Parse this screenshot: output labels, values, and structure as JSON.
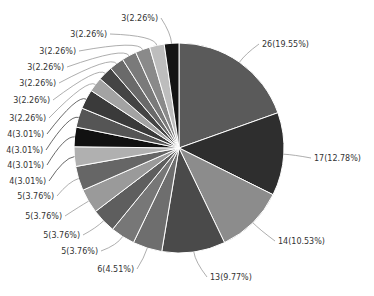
{
  "chart_data": {
    "type": "pie",
    "title": "",
    "total": 133,
    "start_angle_deg": 0,
    "direction": "clockwise",
    "label_format": "{value}({percent}%)",
    "slices": [
      {
        "value": 26,
        "percent": "19.55",
        "color": "#5a5a5a"
      },
      {
        "value": 17,
        "percent": "12.78",
        "color": "#2e2e2e"
      },
      {
        "value": 14,
        "percent": "10.53",
        "color": "#8c8c8c"
      },
      {
        "value": 13,
        "percent": "9.77",
        "color": "#4a4a4a"
      },
      {
        "value": 6,
        "percent": "4.51",
        "color": "#6e6e6e"
      },
      {
        "value": 5,
        "percent": "3.76",
        "color": "#777777"
      },
      {
        "value": 5,
        "percent": "3.76",
        "color": "#5e5e5e"
      },
      {
        "value": 5,
        "percent": "3.76",
        "color": "#9a9a9a"
      },
      {
        "value": 5,
        "percent": "3.76",
        "color": "#666666"
      },
      {
        "value": 4,
        "percent": "3.01",
        "color": "#b0b0b0"
      },
      {
        "value": 4,
        "percent": "3.01",
        "color": "#111111"
      },
      {
        "value": 4,
        "percent": "3.01",
        "color": "#555555"
      },
      {
        "value": 4,
        "percent": "3.01",
        "color": "#3a3a3a"
      },
      {
        "value": 3,
        "percent": "2.26",
        "color": "#a3a3a3"
      },
      {
        "value": 3,
        "percent": "2.26",
        "color": "#444444"
      },
      {
        "value": 3,
        "percent": "2.26",
        "color": "#6a6a6a"
      },
      {
        "value": 3,
        "percent": "2.26",
        "color": "#7a7a7a"
      },
      {
        "value": 3,
        "percent": "2.26",
        "color": "#8a8a8a"
      },
      {
        "value": 3,
        "percent": "2.26",
        "color": "#bdbdbd"
      },
      {
        "value": 3,
        "percent": "2.26",
        "color": "#151515"
      }
    ],
    "labels": [
      {
        "text": "26(19.55%)",
        "x": 262,
        "y": 47,
        "anchor": "start"
      },
      {
        "text": "17(12.78%)",
        "x": 314,
        "y": 161,
        "anchor": "start"
      },
      {
        "text": "14(10.53%)",
        "x": 278,
        "y": 244,
        "anchor": "start"
      },
      {
        "text": "13(9.77%)",
        "x": 210,
        "y": 280,
        "anchor": "start"
      },
      {
        "text": "6(4.51%)",
        "x": 134,
        "y": 272,
        "anchor": "end"
      },
      {
        "text": "5(3.76%)",
        "x": 98,
        "y": 254,
        "anchor": "end"
      },
      {
        "text": "5(3.76%)",
        "x": 80,
        "y": 238,
        "anchor": "end"
      },
      {
        "text": "5(3.76%)",
        "x": 62,
        "y": 219,
        "anchor": "end"
      },
      {
        "text": "5(3.76%)",
        "x": 54,
        "y": 199,
        "anchor": "end"
      },
      {
        "text": "4(3.01%)",
        "x": 46,
        "y": 184,
        "anchor": "end"
      },
      {
        "text": "4(3.01%)",
        "x": 44,
        "y": 168,
        "anchor": "end"
      },
      {
        "text": "4(3.01%)",
        "x": 43,
        "y": 153,
        "anchor": "end"
      },
      {
        "text": "4(3.01%)",
        "x": 44,
        "y": 137,
        "anchor": "end"
      },
      {
        "text": "3(2.26%)",
        "x": 46,
        "y": 121,
        "anchor": "end"
      },
      {
        "text": "3(2.26%)",
        "x": 50,
        "y": 103,
        "anchor": "end"
      },
      {
        "text": "3(2.26%)",
        "x": 56,
        "y": 86,
        "anchor": "end"
      },
      {
        "text": "3(2.26%)",
        "x": 64,
        "y": 70,
        "anchor": "end"
      },
      {
        "text": "3(2.26%)",
        "x": 76,
        "y": 54,
        "anchor": "end"
      },
      {
        "text": "3(2.26%)",
        "x": 107,
        "y": 37,
        "anchor": "end"
      },
      {
        "text": "3(2.26%)",
        "x": 158,
        "y": 21,
        "anchor": "end"
      }
    ],
    "legend": null,
    "grid": false
  },
  "layout": {
    "cx": 179,
    "cy": 148,
    "r": 105,
    "label_line_color": "#999999",
    "slice_border_color": "#ffffff"
  }
}
